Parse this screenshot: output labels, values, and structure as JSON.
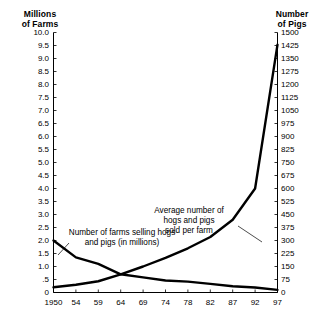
{
  "chart_data": {
    "type": "line",
    "title": "",
    "xlabel": "",
    "x_tick_labels": [
      "1950",
      "54",
      "59",
      "64",
      "69",
      "74",
      "78",
      "82",
      "87",
      "92",
      "97"
    ],
    "x": [
      1950,
      1954,
      1959,
      1964,
      1969,
      1974,
      1978,
      1982,
      1987,
      1992,
      1997
    ],
    "grid": false,
    "legend_position": "inline-annotations",
    "left_axis": {
      "label": "Millions\nof Farms",
      "ylim": [
        0,
        10.0
      ],
      "tick_step": 0.5,
      "tick_labels": [
        "10.0",
        "9.5",
        "9.0",
        "8.5",
        "8.0",
        "7.5",
        "7.0",
        "6.5",
        "6.0",
        "5.5",
        "5.0",
        "4.5",
        "4.0",
        "3.5",
        "3.0",
        "2.5",
        "2.0",
        "1.5",
        "1.0",
        ".5",
        "0"
      ]
    },
    "right_axis": {
      "label": "Number\nof Pigs",
      "ylim": [
        0,
        1500
      ],
      "tick_step": 75,
      "tick_labels": [
        "1500",
        "1425",
        "1350",
        "1275",
        "1200",
        "1125",
        "1050",
        "975",
        "900",
        "825",
        "750",
        "675",
        "600",
        "525",
        "450",
        "375",
        "300",
        "225",
        "150",
        "75",
        "0"
      ]
    },
    "series": [
      {
        "name": "Number of farms selling hogs and pigs (in millions)",
        "axis": "left",
        "annotation": "Number of farms selling hogs\nand pigs (in millions)",
        "color": "#000000",
        "values": [
          2.0,
          1.35,
          1.1,
          0.7,
          0.58,
          0.46,
          0.42,
          0.33,
          0.24,
          0.19,
          0.1
        ]
      },
      {
        "name": "Average number of hogs and pigs sold per farm",
        "axis": "right",
        "annotation": "Average number of\nhogs and pigs\nsold per farm",
        "color": "#000000",
        "values": [
          30,
          45,
          65,
          105,
          150,
          200,
          255,
          320,
          420,
          600,
          1430
        ]
      }
    ]
  },
  "axes": {
    "left_title": "Millions\nof Farms",
    "right_title": "Number\nof Pigs"
  },
  "annotations": {
    "average": "Average number of\nhogs and pigs\nsold per farm",
    "farms": "Number of farms selling hogs\nand pigs (in millions)"
  }
}
